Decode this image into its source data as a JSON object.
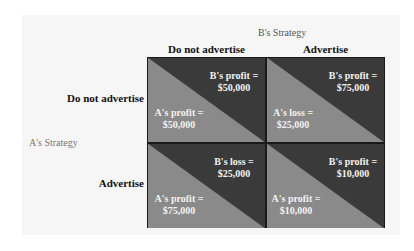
{
  "title_b": "B's Strategy",
  "title_a": "A's Strategy",
  "columns": [
    "Do not advertise",
    "Advertise"
  ],
  "rows": [
    "Do not advertise",
    "Advertise"
  ],
  "colors": {
    "dark": "#3a3a3a",
    "light": "#8a8a8a",
    "border": "#1a1a1a"
  },
  "cells": [
    {
      "b_label": "B's profit =",
      "b_value": "$50,000",
      "a_label": "A's profit =",
      "a_value": "$50,000"
    },
    {
      "b_label": "B's profit =",
      "b_value": "$75,000",
      "a_label": "A's loss =",
      "a_value": "$25,000"
    },
    {
      "b_label": "B's loss =",
      "b_value": "$25,000",
      "a_label": "A's profit =",
      "a_value": "$75,000"
    },
    {
      "b_label": "B's profit =",
      "b_value": "$10,000",
      "a_label": "A's profit =",
      "a_value": "$10,000"
    }
  ]
}
